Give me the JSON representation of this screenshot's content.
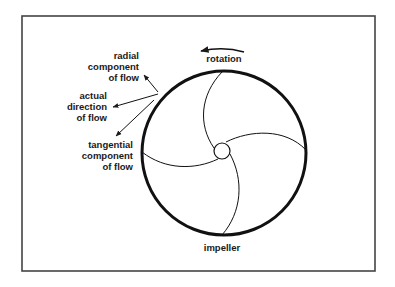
{
  "diagram": {
    "labels": {
      "rotation": "rotation",
      "impeller": "impeller",
      "radial": [
        "radial",
        "component",
        "of flow"
      ],
      "actual": [
        "actual",
        "direction",
        "of flow"
      ],
      "tangential": [
        "tangential",
        "component",
        "of flow"
      ]
    },
    "colors": {
      "ink": "#1a1a1a",
      "frame": "#444444",
      "background": "#ffffff"
    }
  }
}
